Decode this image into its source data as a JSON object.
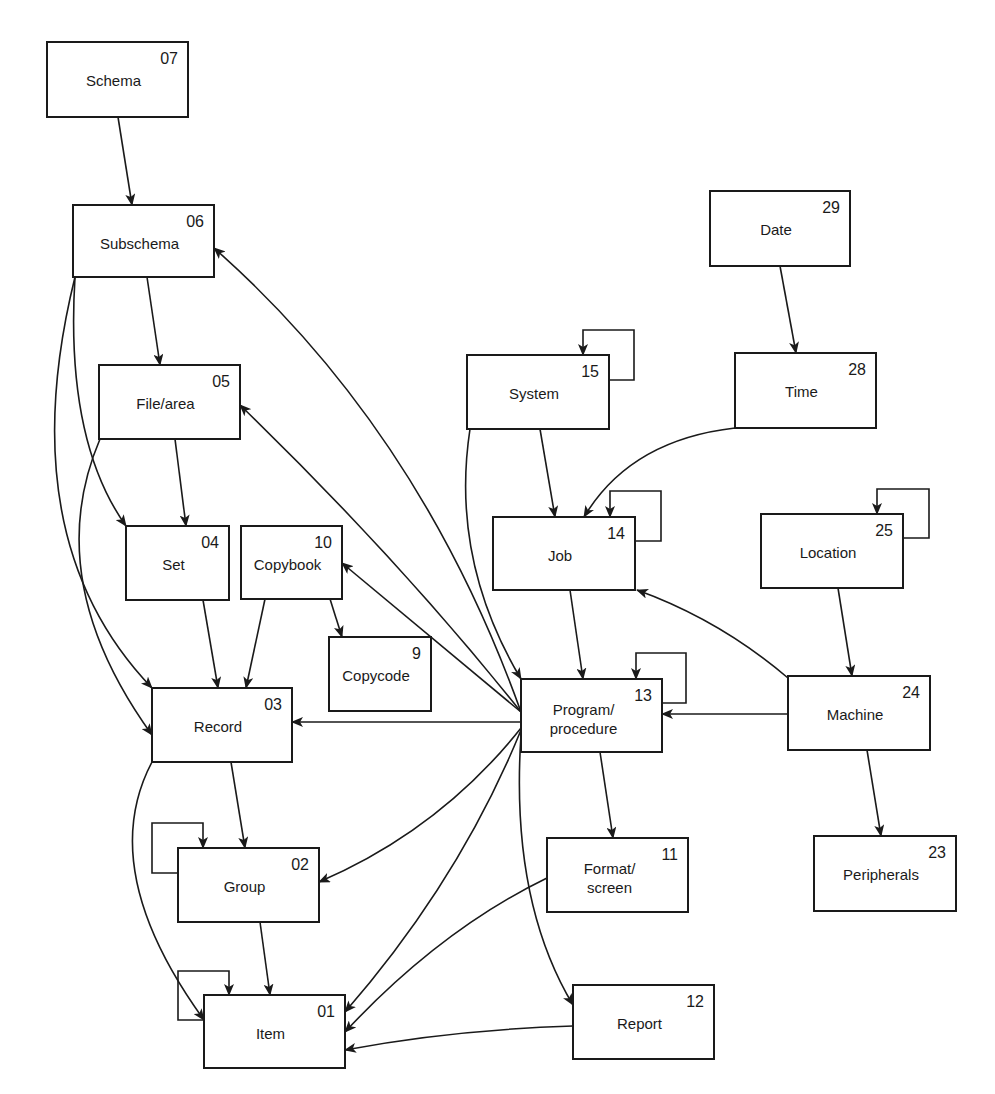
{
  "diagram": {
    "type": "entity-relationship / data dictionary structure",
    "colors": {
      "line": "#1a1a1a",
      "background": "#ffffff",
      "box_fill": "#ffffff"
    },
    "nodes": [
      {
        "id": "schema",
        "label": [
          "Schema"
        ],
        "num": "07",
        "x": 47,
        "y": 42,
        "w": 141,
        "h": 75
      },
      {
        "id": "subschema",
        "label": [
          "Subschema"
        ],
        "num": "06",
        "x": 73,
        "y": 205,
        "w": 141,
        "h": 72
      },
      {
        "id": "file-area",
        "label": [
          "File/area"
        ],
        "num": "05",
        "x": 99,
        "y": 365,
        "w": 141,
        "h": 74
      },
      {
        "id": "set",
        "label": [
          "Set"
        ],
        "num": "04",
        "x": 126,
        "y": 526,
        "w": 103,
        "h": 74
      },
      {
        "id": "copybook",
        "label": [
          "Copybook"
        ],
        "num": "10",
        "x": 241,
        "y": 526,
        "w": 101,
        "h": 73
      },
      {
        "id": "copycode",
        "label": [
          "Copycode"
        ],
        "num": "9",
        "x": 329,
        "y": 637,
        "w": 102,
        "h": 74
      },
      {
        "id": "record",
        "label": [
          "Record"
        ],
        "num": "03",
        "x": 152,
        "y": 688,
        "w": 140,
        "h": 74
      },
      {
        "id": "group",
        "label": [
          "Group"
        ],
        "num": "02",
        "x": 178,
        "y": 848,
        "w": 141,
        "h": 74
      },
      {
        "id": "item",
        "label": [
          "Item"
        ],
        "num": "01",
        "x": 204,
        "y": 995,
        "w": 141,
        "h": 73
      },
      {
        "id": "system",
        "label": [
          "System"
        ],
        "num": "15",
        "x": 467,
        "y": 355,
        "w": 142,
        "h": 74
      },
      {
        "id": "job",
        "label": [
          "Job"
        ],
        "num": "14",
        "x": 493,
        "y": 517,
        "w": 142,
        "h": 73
      },
      {
        "id": "program",
        "label": [
          "Program/",
          "procedure"
        ],
        "num": "13",
        "x": 521,
        "y": 679,
        "w": 141,
        "h": 73
      },
      {
        "id": "format",
        "label": [
          "Format/",
          "screen"
        ],
        "num": "11",
        "x": 547,
        "y": 838,
        "w": 141,
        "h": 74
      },
      {
        "id": "report",
        "label": [
          "Report"
        ],
        "num": "12",
        "x": 573,
        "y": 985,
        "w": 141,
        "h": 74
      },
      {
        "id": "date",
        "label": [
          "Date"
        ],
        "num": "29",
        "x": 710,
        "y": 191,
        "w": 140,
        "h": 75
      },
      {
        "id": "time",
        "label": [
          "Time"
        ],
        "num": "28",
        "x": 735,
        "y": 353,
        "w": 141,
        "h": 75
      },
      {
        "id": "location",
        "label": [
          "Location"
        ],
        "num": "25",
        "x": 761,
        "y": 514,
        "w": 142,
        "h": 74
      },
      {
        "id": "machine",
        "label": [
          "Machine"
        ],
        "num": "24",
        "x": 788,
        "y": 676,
        "w": 142,
        "h": 74
      },
      {
        "id": "peripherals",
        "label": [
          "Peripherals"
        ],
        "num": "23",
        "x": 814,
        "y": 836,
        "w": 142,
        "h": 75
      }
    ],
    "edges": [
      {
        "from": "schema",
        "to": "subschema",
        "d": "M 118 117 L 132 205"
      },
      {
        "from": "subschema",
        "to": "file-area",
        "d": "M 147 277 L 160 365"
      },
      {
        "from": "subschema",
        "to": "set",
        "d": "M 75 277 Q 65 440 126 526"
      },
      {
        "from": "subschema",
        "to": "record",
        "d": "M 75 277 Q 10 540 152 688"
      },
      {
        "from": "file-area",
        "to": "set",
        "d": "M 175 439 L 186 526"
      },
      {
        "from": "file-area",
        "to": "record",
        "d": "M 100 439 Q 40 580 152 735"
      },
      {
        "from": "set",
        "to": "record",
        "d": "M 203 600 L 218 688"
      },
      {
        "from": "copybook",
        "to": "record",
        "d": "M 265 599 L 246 688"
      },
      {
        "from": "copybook",
        "to": "copycode",
        "d": "M 330 599 L 342 637"
      },
      {
        "from": "record",
        "to": "group",
        "d": "M 231 762 L 245 848"
      },
      {
        "from": "record",
        "to": "item",
        "d": "M 152 762 Q 95 870 204 1020"
      },
      {
        "from": "group",
        "to": "item",
        "d": "M 260 922 L 270 995"
      },
      {
        "from": "program",
        "to": "subschema",
        "d": "M 521 712 Q 420 430 214 248"
      },
      {
        "from": "program",
        "to": "file-area",
        "d": "M 521 712 Q 400 560 240 405"
      },
      {
        "from": "program",
        "to": "copybook",
        "d": "M 521 712 L 342 563"
      },
      {
        "from": "program",
        "to": "record",
        "d": "M 521 722 L 292 722"
      },
      {
        "from": "program",
        "to": "group",
        "d": "M 521 728 Q 440 830 319 882"
      },
      {
        "from": "program",
        "to": "item",
        "d": "M 521 730 Q 460 880 345 1012"
      },
      {
        "from": "program",
        "to": "report",
        "d": "M 521 735 Q 510 900 573 1005"
      },
      {
        "from": "program",
        "to": "format",
        "d": "M 600 752 L 613 838"
      },
      {
        "from": "format",
        "to": "item",
        "d": "M 547 878 Q 440 930 345 1032"
      },
      {
        "from": "report",
        "to": "item",
        "d": "M 573 1026 Q 450 1030 345 1050"
      },
      {
        "from": "system",
        "to": "program",
        "d": "M 470 429 Q 450 560 521 679"
      },
      {
        "from": "system",
        "to": "job",
        "d": "M 540 429 L 555 517"
      },
      {
        "from": "job",
        "to": "program",
        "d": "M 570 590 L 583 679"
      },
      {
        "from": "date",
        "to": "time",
        "d": "M 780 266 L 796 353"
      },
      {
        "from": "time",
        "to": "job",
        "d": "M 735 428 Q 630 440 584 517"
      },
      {
        "from": "location",
        "to": "machine",
        "d": "M 838 588 L 852 676"
      },
      {
        "from": "machine",
        "to": "job",
        "d": "M 788 678 Q 720 620 637 590"
      },
      {
        "from": "machine",
        "to": "program",
        "d": "M 788 714 L 662 714"
      },
      {
        "from": "machine",
        "to": "peripherals",
        "d": "M 867 750 L 881 836"
      }
    ],
    "self_loops": [
      {
        "node": "group",
        "d": "M 178 873 L 152 873 L 152 823 L 203 823 L 203 848"
      },
      {
        "node": "item",
        "d": "M 204 1020 L 178 1020 L 178 971 L 229 971 L 229 995"
      },
      {
        "node": "system",
        "d": "M 609 380 L 634 380 L 634 330 L 583 330 L 583 355"
      },
      {
        "node": "job",
        "d": "M 635 541 L 661 541 L 661 491 L 610 491 L 610 517"
      },
      {
        "node": "program",
        "d": "M 662 703 L 686 703 L 686 653 L 636 653 L 636 679"
      },
      {
        "node": "location",
        "d": "M 903 538 L 929 538 L 929 489 L 877 489 L 877 514"
      }
    ]
  }
}
